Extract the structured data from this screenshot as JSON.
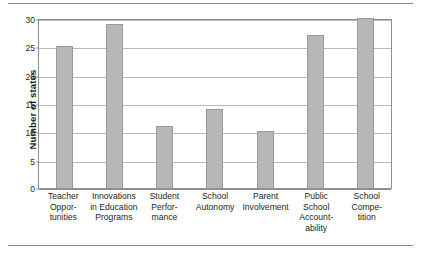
{
  "chart_data": {
    "type": "bar",
    "title": "",
    "xlabel": "",
    "ylabel": "Number of states",
    "ylim": [
      0,
      30
    ],
    "ytick_values": [
      30,
      25,
      20,
      15,
      10,
      5,
      0
    ],
    "ytick_labels": [
      "30",
      "25",
      "20",
      "15",
      "10",
      "5",
      "0"
    ],
    "grid": true,
    "legend": "none",
    "orientation": "vertical",
    "categories": [
      "Teacher Opportunities",
      "Innovations in Education Programs",
      "Student Performance",
      "School Autonomy",
      "Parent Involvement",
      "Public School Accountability",
      "School Competition"
    ],
    "category_label_lines": [
      [
        "Teacher",
        "Oppor-",
        "tunities"
      ],
      [
        "Innovations",
        "in Education",
        "Programs"
      ],
      [
        "Student",
        "Perfor-",
        "mance"
      ],
      [
        "School",
        "Autonomy"
      ],
      [
        "Parent",
        "Involvement"
      ],
      [
        "Public",
        "School",
        "Account-",
        "ability"
      ],
      [
        "School",
        "Compe-",
        "tition"
      ]
    ],
    "values": [
      25,
      29,
      11,
      14,
      10,
      27,
      30
    ],
    "bar_color": "#b7b7b7",
    "bar_border_color": "#9a9a9a",
    "gridline_color": "#b9b9b9",
    "axis_color": "#8f8f8f",
    "rule_color": "#8a8a8a"
  }
}
